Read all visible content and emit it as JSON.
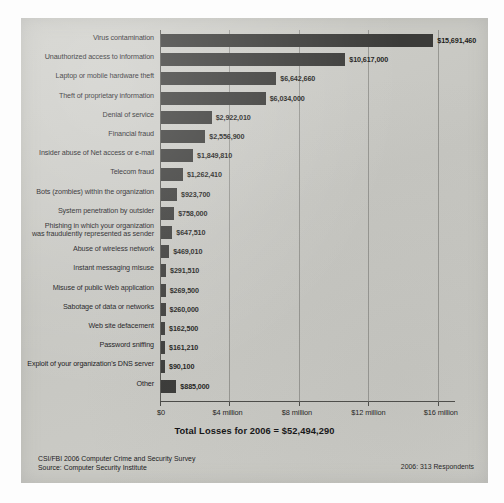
{
  "chart_data": {
    "type": "bar",
    "orientation": "horizontal",
    "title": "",
    "xlabel": "",
    "ylabel": "",
    "xlim": [
      0,
      17000000
    ],
    "grid": true,
    "legend": "none",
    "tick_labels": [
      "$0",
      "$4 million",
      "$8 million",
      "$12 million",
      "$16 million"
    ],
    "tick_values": [
      0,
      4000000,
      8000000,
      12000000,
      16000000
    ],
    "categories": [
      "Virus contamination",
      "Unauthorized access to information",
      "Laptop or mobile hardware theft",
      "Theft of proprietary information",
      "Denial of service",
      "Financial fraud",
      "Insider abuse of Net access or e-mail",
      "Telecom fraud",
      "Bots (zombies) within the organization",
      "System penetration by outsider",
      "Phishing in which your organization\nwas fraudulently represented as sender",
      "Abuse of wireless network",
      "Instant messaging misuse",
      "Misuse of public Web application",
      "Sabotage of data or networks",
      "Web site defacement",
      "Password sniffing",
      "Exploit of your organization's DNS server",
      "Other"
    ],
    "values": [
      15691460,
      10617000,
      6642660,
      6034000,
      2922010,
      2556900,
      1849810,
      1262410,
      923700,
      758000,
      647510,
      469010,
      291510,
      269500,
      260000,
      162500,
      161210,
      90100,
      885000
    ],
    "value_labels": [
      "$15,691,460",
      "$10,617,000",
      "$6,642,660",
      "$6,034,000",
      "$2,922,010",
      "$2,556,900",
      "$1,849,810",
      "$1,262,410",
      "$923,700",
      "$758,000",
      "$647,510",
      "$469,010",
      "$291,510",
      "$269,500",
      "$260,000",
      "$162,500",
      "$161,210",
      "$90,100",
      "$885,000"
    ],
    "bar_color": "#3b3b39",
    "panel_color": "#c9c9c5"
  },
  "annotations": {
    "total": "Total Losses for 2006 = $52,494,290"
  },
  "footer": {
    "source": "CSI/FBI 2006 Computer Crime and Security Survey\nSource: Computer Security Institute",
    "respondents": "2006: 313 Respondents"
  }
}
